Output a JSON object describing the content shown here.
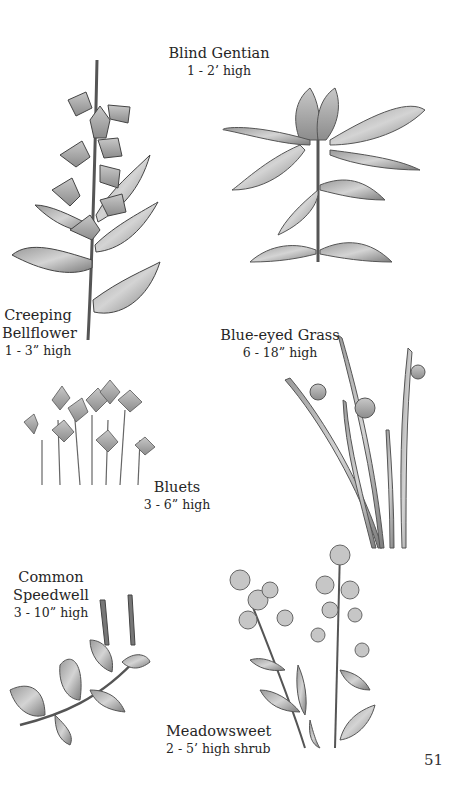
{
  "page": {
    "page_number": "51",
    "plants": [
      {
        "name": "Blind Gentian",
        "height": "1 - 2’ high"
      },
      {
        "name_lines": [
          "Creeping",
          "Bellflower"
        ],
        "height": "1 - 3” high"
      },
      {
        "name": "Blue-eyed Grass",
        "height": "6 - 18” high"
      },
      {
        "name": "Bluets",
        "height": "3 - 6” high"
      },
      {
        "name_lines": [
          "Common",
          "Speedwell"
        ],
        "height": "3 - 10” high"
      },
      {
        "name": "Meadowsweet",
        "height": "2 - 5’ high shrub"
      }
    ],
    "illustrations": [
      "creeping-bellflower",
      "blind-gentian",
      "bluets",
      "blue-eyed-grass",
      "common-speedwell",
      "meadowsweet"
    ]
  }
}
